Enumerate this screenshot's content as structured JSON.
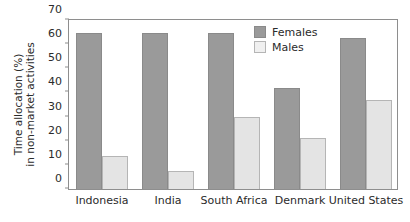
{
  "chart_data": {
    "type": "bar",
    "title": "",
    "xlabel": "",
    "ylabel_line1": "Time allocation (%)",
    "ylabel_line2": "in non-market activities",
    "categories": [
      "Indonesia",
      "India",
      "South Africa",
      "Denmark",
      "United States"
    ],
    "series": [
      {
        "name": "Females",
        "color": "#9a9a9a",
        "values": [
          64.5,
          64.5,
          64.5,
          42,
          62.5
        ]
      },
      {
        "name": "Males",
        "color": "#e4e4e4",
        "values": [
          13.5,
          7.5,
          30,
          21,
          37
        ]
      }
    ],
    "ylim": [
      0,
      70
    ],
    "ytick_labels": [
      "0",
      "10",
      "20",
      "30",
      "40",
      "50",
      "60",
      "70"
    ],
    "ytick_values": [
      0,
      10,
      20,
      30,
      40,
      50,
      60,
      70
    ],
    "grid": false,
    "legend_position": "top-right"
  }
}
